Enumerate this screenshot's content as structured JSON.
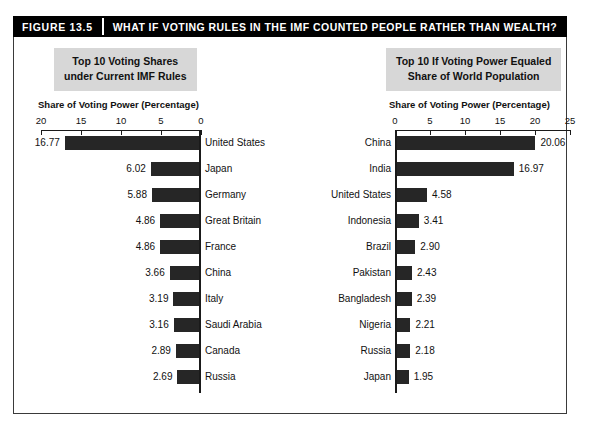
{
  "figure": {
    "number": "FIGURE 13.5",
    "title": "WHAT IF VOTING RULES IN THE IMF COUNTED PEOPLE RATHER THAN WEALTH?"
  },
  "left_panel": {
    "heading_line1": "Top 10 Voting Shares",
    "heading_line2": "under Current IMF Rules",
    "axis_caption": "Share of Voting Power (Percentage)"
  },
  "right_panel": {
    "heading_line1": "Top 10 If Voting Power Equaled",
    "heading_line2": "Share of World Population",
    "axis_caption": "Share of Voting Power (Percentage)"
  },
  "chart_data": [
    {
      "type": "bar",
      "orientation": "horizontal-left",
      "title": "Top 10 Voting Shares under Current IMF Rules",
      "xlabel": "Share of Voting Power (Percentage)",
      "ylabel": "",
      "xlim": [
        0,
        20
      ],
      "xticks": [
        20,
        15,
        10,
        5,
        0
      ],
      "axis_reversed": true,
      "grid": false,
      "legend": "none",
      "bar_color": "#262626",
      "categories": [
        "United States",
        "Japan",
        "Germany",
        "Great Britain",
        "France",
        "China",
        "Italy",
        "Saudi Arabia",
        "Canada",
        "Russia"
      ],
      "values": [
        16.77,
        6.02,
        5.88,
        4.86,
        4.86,
        3.66,
        3.19,
        3.16,
        2.89,
        2.69
      ],
      "value_labels": [
        "16.77",
        "6.02",
        "5.88",
        "4.86",
        "4.86",
        "3.66",
        "3.19",
        "3.16",
        "2.89",
        "2.69"
      ]
    },
    {
      "type": "bar",
      "orientation": "horizontal-right",
      "title": "Top 10 If Voting Power Equaled Share of World Population",
      "xlabel": "Share of Voting Power (Percentage)",
      "ylabel": "",
      "xlim": [
        0,
        25
      ],
      "xticks": [
        0,
        5,
        10,
        15,
        20,
        25
      ],
      "axis_reversed": false,
      "grid": false,
      "legend": "none",
      "bar_color": "#262626",
      "categories": [
        "China",
        "India",
        "United States",
        "Indonesia",
        "Brazil",
        "Pakistan",
        "Bangladesh",
        "Nigeria",
        "Russia",
        "Japan"
      ],
      "values": [
        20.06,
        16.97,
        4.58,
        3.41,
        2.9,
        2.43,
        2.39,
        2.21,
        2.18,
        1.95
      ],
      "value_labels": [
        "20.06",
        "16.97",
        "4.58",
        "3.41",
        "2.90",
        "2.43",
        "2.39",
        "2.21",
        "2.18",
        "1.95"
      ]
    }
  ]
}
